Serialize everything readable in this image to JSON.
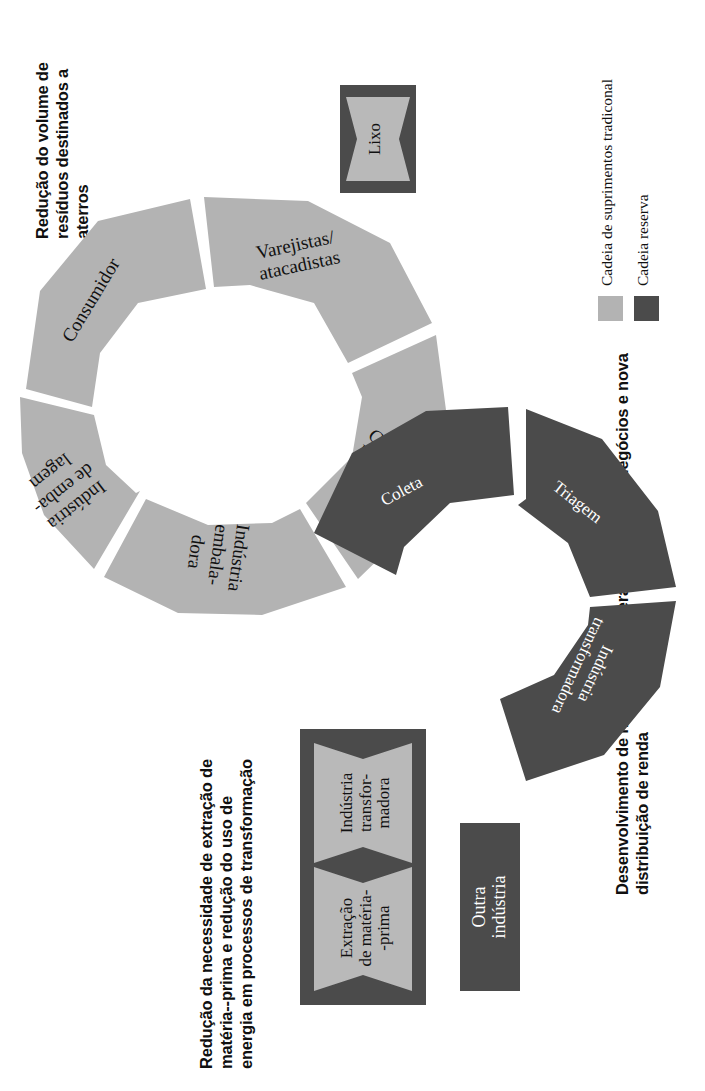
{
  "figure": {
    "type": "cycle-diagram",
    "rotation_deg": -90,
    "colors": {
      "traditional_chain": "#b3b3b3",
      "reverse_chain": "#4b4b4b",
      "background": "#ffffff",
      "text_dark": "#111111",
      "text_light": "#ffffff"
    }
  },
  "headings": {
    "waste_reduction": "Redução do volume de resíduos destinados a aterros",
    "new_actors": "Desenvolvimento de novos atores: Geração de novos negócios e nova distribuição de renda",
    "raw_material": "Redução da necessidade de extração de matéria--prima e redução do uso de energia em processos de transformação"
  },
  "legend": {
    "items": [
      {
        "swatch": "light",
        "label": "Cadeia de suprimentos tradiconal"
      },
      {
        "swatch": "dark",
        "label": "Cadeia reserva"
      }
    ]
  },
  "traditional_chain": {
    "name": "Cadeia de suprimentos tradiconal",
    "segments": [
      {
        "id": "consumidor",
        "label": "Consumidor"
      },
      {
        "id": "varejistas",
        "label": "Varejistas/\natacadistas"
      },
      {
        "id": "cds-hubs",
        "label": "CDs/\nhubs"
      },
      {
        "id": "industria-embaladora",
        "label": "Indústria\nembala-\ndora"
      },
      {
        "id": "industria-de-embalagem",
        "label": "Indústria\nde emba-\nlagem"
      }
    ]
  },
  "reverse_chain": {
    "name": "Cadeia reserva",
    "segments": [
      {
        "id": "coleta",
        "label": "Coleta"
      },
      {
        "id": "triagem",
        "label": "Triagem"
      },
      {
        "id": "industria-transformadora",
        "label": "Indústria\ntransformadora"
      }
    ]
  },
  "boxes": {
    "lixo": {
      "label": "Lixo",
      "style": "chevron-on-dark"
    },
    "outra_industria": {
      "label": "Outra\nindústria",
      "style": "solid-dark"
    },
    "raw_material_group": {
      "chevrons": [
        {
          "id": "extracao",
          "label": "Extração\nde matéria-\n-prima"
        },
        {
          "id": "industria-transformadora-box",
          "label": "Indústria\ntransfor-\nmadora"
        }
      ]
    }
  }
}
